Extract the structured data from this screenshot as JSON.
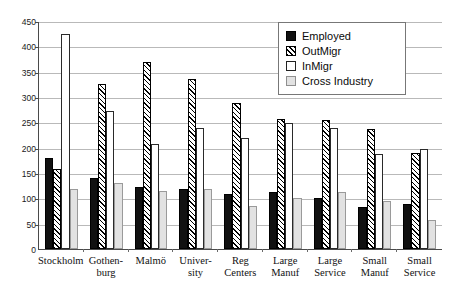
{
  "chart_data": {
    "type": "bar",
    "title": "",
    "xlabel": "",
    "ylabel": "",
    "ylim": [
      0,
      450
    ],
    "yticks": [
      0,
      50,
      100,
      150,
      200,
      250,
      300,
      350,
      400,
      450
    ],
    "grid": true,
    "legend_position": "top-right",
    "categories": [
      "Stockholm",
      "Gothen-\nburg",
      "Malmö",
      "Univer-\nsity",
      "Reg\nCenters",
      "Large\nManuf",
      "Large\nService",
      "Small\nManuf",
      "Small\nService"
    ],
    "series": [
      {
        "name": "Employed",
        "values": [
          180,
          140,
          122,
          118,
          108,
          112,
          100,
          82,
          88
        ]
      },
      {
        "name": "OutMigr",
        "values": [
          158,
          325,
          370,
          335,
          288,
          257,
          255,
          237,
          190
        ]
      },
      {
        "name": "InMigr",
        "values": [
          425,
          272,
          207,
          238,
          220,
          248,
          238,
          188,
          197
        ]
      },
      {
        "name": "Cross Industry",
        "values": [
          118,
          130,
          115,
          118,
          85,
          100,
          112,
          95,
          57
        ]
      }
    ]
  },
  "legend": {
    "items": [
      {
        "label": "Employed",
        "swatch": "solid-black-swatch"
      },
      {
        "label": "OutMigr",
        "swatch": "diagonal-hatch-swatch"
      },
      {
        "label": "InMigr",
        "swatch": "white-outline-swatch"
      },
      {
        "label": "Cross Industry",
        "swatch": "light-gray-swatch"
      }
    ]
  }
}
